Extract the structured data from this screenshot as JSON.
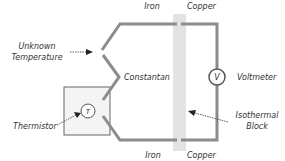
{
  "diagram": {
    "type": "thermocouple-circuit",
    "labels": {
      "iron_top": "Iron",
      "copper_top": "Copper",
      "iron_bottom": "Iron",
      "copper_bottom": "Copper",
      "unknown_temp_line1": "Unknown",
      "unknown_temp_line2": "Temperature",
      "constantan": "Constantan",
      "thermistor": "Thermistor",
      "voltmeter": "Voltmeter",
      "isothermal_line1": "Isothermal",
      "isothermal_line2": "Block"
    },
    "symbols": {
      "voltmeter": "V",
      "thermistor": "T"
    },
    "colors": {
      "wire": "#8c8c8c",
      "block": "#e3e3e3",
      "box_fill": "#f4f4f4",
      "box_stroke": "#666666",
      "text": "#333333"
    }
  }
}
